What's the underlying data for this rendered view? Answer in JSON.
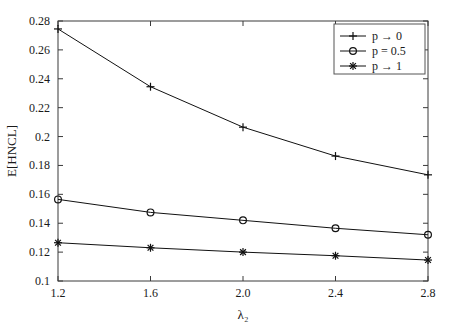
{
  "chart_data": {
    "type": "line",
    "title": "",
    "xlabel": "λ₂",
    "ylabel": "E[HNCL]",
    "x": [
      1.2,
      1.6,
      2.0,
      2.4,
      2.8
    ],
    "xlim": [
      1.2,
      2.8
    ],
    "ylim": [
      0.1,
      0.28
    ],
    "xticks": [
      "1.2",
      "1.6",
      "2.0",
      "2.4",
      "2.8"
    ],
    "yticks": [
      "0.1",
      "0.12",
      "0.14",
      "0.16",
      "0.18",
      "0.2",
      "0.22",
      "0.24",
      "0.26",
      "0.28"
    ],
    "ytick_values": [
      0.1,
      0.12,
      0.14,
      0.16,
      0.18,
      0.2,
      0.22,
      0.24,
      0.26,
      0.28
    ],
    "grid": false,
    "legend_position": "upper right",
    "series": [
      {
        "name": "p → 0",
        "marker": "plus",
        "values": [
          0.2745,
          0.2345,
          0.2065,
          0.1865,
          0.1735
        ]
      },
      {
        "name": "p = 0.5",
        "marker": "circle",
        "values": [
          0.1565,
          0.1475,
          0.142,
          0.1365,
          0.132
        ]
      },
      {
        "name": "p → 1",
        "marker": "asterisk",
        "values": [
          0.1265,
          0.123,
          0.12,
          0.1175,
          0.1145
        ]
      }
    ],
    "colors": {
      "line": "#111111",
      "frame": "#3a3a3a",
      "text": "#1a1a1a",
      "background": "#ffffff"
    }
  }
}
